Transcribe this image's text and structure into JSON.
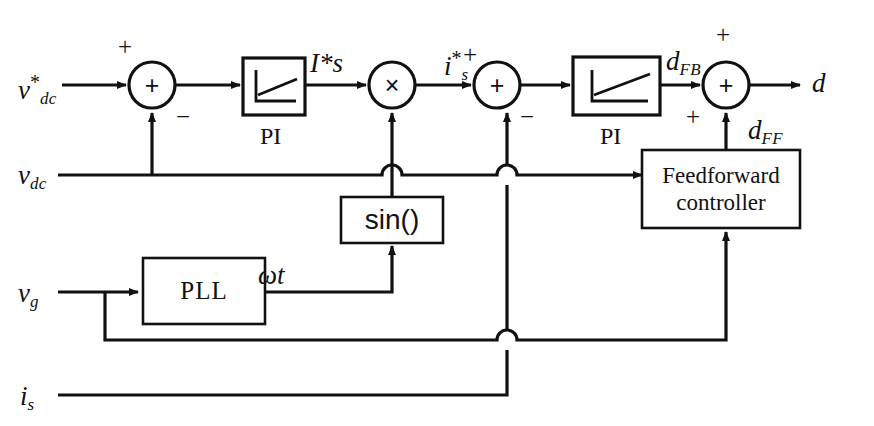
{
  "diagram": {
    "stroke_color": "#111111",
    "background": "#ffffff",
    "inputs": [
      {
        "name": "vdc-ref-input",
        "label_base": "v",
        "label_sub": "dc",
        "label_sup": "*",
        "x": 18,
        "y": 72
      },
      {
        "name": "vdc-feedback-input",
        "label_base": "v",
        "label_sub": "dc",
        "label_sup": "",
        "x": 18,
        "y": 162
      },
      {
        "name": "vg-input",
        "label_base": "v",
        "label_sub": "g",
        "label_sup": "",
        "x": 18,
        "y": 280
      },
      {
        "name": "is-input",
        "label_base": "i",
        "label_sub": "s",
        "label_sup": "",
        "x": 20,
        "y": 383
      }
    ],
    "signals": [
      {
        "name": "current-ref-amplitude",
        "label_base": "I",
        "label_sub": "s",
        "label_sup": "*",
        "x": 310,
        "y": 50
      },
      {
        "name": "current-ref",
        "label_base": "i",
        "label_sub": "s",
        "label_sup": "*",
        "x": 444,
        "y": 48
      },
      {
        "name": "duty-feedback",
        "label_base": "d",
        "label_sub": "FB",
        "label_sup": "",
        "x": 666,
        "y": 48
      },
      {
        "name": "duty-feedforward",
        "label_base": "d",
        "label_sub": "FF",
        "label_sup": "",
        "x": 748,
        "y": 117
      },
      {
        "name": "duty-output",
        "label_base": "d",
        "label_sub": "",
        "label_sup": "",
        "x": 812,
        "y": 70
      },
      {
        "name": "phase-angle",
        "label_base": "ωt",
        "label_sub": "",
        "label_sup": "",
        "x": 258,
        "y": 262
      }
    ],
    "blocks": [
      {
        "name": "pi-block-voltage",
        "kind": "saturation",
        "caption": "PI",
        "x": 243,
        "y": 58,
        "w": 62,
        "h": 57
      },
      {
        "name": "pi-block-current",
        "kind": "saturation",
        "caption": "PI",
        "x": 573,
        "y": 57,
        "w": 87,
        "h": 58
      },
      {
        "name": "sin-block",
        "kind": "text",
        "caption": "sin()",
        "x": 341,
        "y": 197,
        "w": 102,
        "h": 46
      },
      {
        "name": "feedforward-controller-block",
        "kind": "text",
        "caption": "Feedforward controller",
        "x": 642,
        "y": 150,
        "w": 158,
        "h": 78
      },
      {
        "name": "pll-block",
        "kind": "text",
        "caption": "PLL",
        "x": 143,
        "y": 258,
        "w": 122,
        "h": 66
      }
    ],
    "junctions": [
      {
        "name": "summing-junction-voltage",
        "op": "+",
        "cx": 152,
        "cy": 85,
        "r": 23,
        "signs": [
          {
            "label": "+",
            "x": 118,
            "y": 34
          },
          {
            "label": "−",
            "x": 176,
            "y": 104
          }
        ]
      },
      {
        "name": "multiplier-junction",
        "op": "×",
        "cx": 392,
        "cy": 85,
        "r": 23,
        "signs": []
      },
      {
        "name": "summing-junction-current",
        "op": "+",
        "cx": 497,
        "cy": 85,
        "r": 23,
        "signs": [
          {
            "label": "+",
            "x": 463,
            "y": 42
          },
          {
            "label": "−",
            "x": 520,
            "y": 104
          }
        ]
      },
      {
        "name": "summing-junction-duty",
        "op": "+",
        "cx": 726,
        "cy": 85,
        "r": 23,
        "signs": [
          {
            "label": "+",
            "x": 716,
            "y": 22
          },
          {
            "label": "+",
            "x": 686,
            "y": 104
          }
        ]
      }
    ],
    "captions": [
      {
        "name": "pi-caption-voltage",
        "text": "PI",
        "x": 260,
        "y": 124
      },
      {
        "name": "pi-caption-current",
        "text": "PI",
        "x": 600,
        "y": 124
      }
    ]
  }
}
